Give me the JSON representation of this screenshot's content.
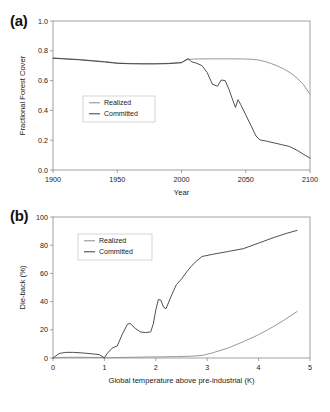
{
  "figure": {
    "panels": [
      {
        "id": "a",
        "label": "(a)",
        "xlabel": "Year",
        "ylabel": "Fractional Forest Cover",
        "xticks": [
          "1900",
          "1950",
          "2000",
          "2050",
          "2100"
        ],
        "yticks": [
          "0.0",
          "0.2",
          "0.4",
          "0.6",
          "0.8",
          "1.0"
        ],
        "legend": [
          {
            "name": "Realized",
            "color": "#8c8c8c"
          },
          {
            "name": "Committed",
            "color": "#3c3c3c"
          }
        ]
      },
      {
        "id": "b",
        "label": "(b)",
        "xlabel": "Global temperature above pre-industrial (K)",
        "ylabel": "Die-back (%)",
        "xticks": [
          "0",
          "1",
          "2",
          "3",
          "4",
          "5"
        ],
        "yticks": [
          "0",
          "20",
          "40",
          "60",
          "80",
          "100"
        ],
        "legend": [
          {
            "name": "Realized",
            "color": "#8c8c8c"
          },
          {
            "name": "Committed",
            "color": "#3c3c3c"
          }
        ]
      }
    ]
  },
  "chart_data": [
    {
      "type": "line",
      "panel": "a",
      "title": "",
      "xlabel": "Year",
      "ylabel": "Fractional Forest Cover",
      "xlim": [
        1900,
        2100
      ],
      "ylim": [
        0.0,
        1.0
      ],
      "xticks": [
        1900,
        1950,
        2000,
        2050,
        2100
      ],
      "yticks": [
        0.0,
        0.2,
        0.4,
        0.6,
        0.8,
        1.0
      ],
      "grid": false,
      "legend_position": "center-left",
      "series": [
        {
          "name": "Realized",
          "color": "#8c8c8c",
          "x": [
            1900,
            1920,
            1940,
            1950,
            1960,
            1970,
            1980,
            1990,
            2000,
            2005,
            2010,
            2020,
            2030,
            2040,
            2050,
            2055,
            2060,
            2065,
            2070,
            2075,
            2080,
            2085,
            2090,
            2095,
            2100
          ],
          "y": [
            0.752,
            0.742,
            0.728,
            0.718,
            0.715,
            0.714,
            0.714,
            0.716,
            0.722,
            0.742,
            0.745,
            0.746,
            0.746,
            0.746,
            0.745,
            0.743,
            0.738,
            0.728,
            0.714,
            0.697,
            0.676,
            0.651,
            0.617,
            0.572,
            0.508
          ]
        },
        {
          "name": "Committed",
          "color": "#3c3c3c",
          "x": [
            1900,
            1920,
            1940,
            1950,
            1960,
            1970,
            1980,
            1990,
            2000,
            2005,
            2008,
            2012,
            2016,
            2020,
            2024,
            2028,
            2031,
            2034,
            2037,
            2040,
            2042,
            2044,
            2046,
            2050,
            2054,
            2058,
            2061,
            2066,
            2072,
            2078,
            2084,
            2090,
            2096,
            2100
          ],
          "y": [
            0.75,
            0.74,
            0.725,
            0.716,
            0.713,
            0.712,
            0.712,
            0.714,
            0.72,
            0.748,
            0.726,
            0.716,
            0.7,
            0.654,
            0.576,
            0.562,
            0.604,
            0.6,
            0.54,
            0.466,
            0.42,
            0.472,
            0.44,
            0.37,
            0.3,
            0.228,
            0.202,
            0.194,
            0.182,
            0.17,
            0.158,
            0.132,
            0.1,
            0.08
          ]
        }
      ]
    },
    {
      "type": "line",
      "panel": "b",
      "title": "",
      "xlabel": "Global temperature above pre-industrial (K)",
      "ylabel": "Die-back (%)",
      "xlim": [
        0,
        5
      ],
      "ylim": [
        0,
        100
      ],
      "xticks": [
        0,
        1,
        2,
        3,
        4,
        5
      ],
      "yticks": [
        0,
        20,
        40,
        60,
        80,
        100
      ],
      "grid": false,
      "legend_position": "upper-left",
      "series": [
        {
          "name": "Realized",
          "color": "#8c8c8c",
          "x": [
            0.0,
            0.1,
            0.3,
            0.6,
            0.9,
            1.0,
            1.2,
            1.5,
            1.8,
            2.1,
            2.4,
            2.7,
            2.9,
            3.1,
            3.4,
            3.7,
            4.0,
            4.3,
            4.5,
            4.75
          ],
          "y": [
            0.0,
            0.3,
            0.5,
            0.5,
            0.4,
            0.2,
            0.3,
            0.5,
            0.7,
            0.8,
            1.0,
            1.3,
            1.8,
            3.6,
            7.0,
            11.5,
            16.5,
            22.5,
            27.0,
            33.0
          ]
        },
        {
          "name": "Committed",
          "color": "#3c3c3c",
          "x": [
            0.0,
            0.12,
            0.25,
            0.4,
            0.6,
            0.8,
            0.9,
            0.95,
            1.0,
            1.05,
            1.15,
            1.25,
            1.35,
            1.45,
            1.5,
            1.6,
            1.7,
            1.8,
            1.9,
            1.95,
            2.0,
            2.05,
            2.1,
            2.15,
            2.2,
            2.3,
            2.4,
            2.5,
            2.6,
            2.7,
            2.8,
            2.9,
            3.1,
            3.4,
            3.7,
            4.0,
            4.3,
            4.55,
            4.75
          ],
          "y": [
            0.0,
            3.2,
            4.0,
            4.0,
            3.5,
            2.8,
            2.4,
            1.2,
            0.2,
            3.0,
            7.0,
            8.5,
            17.0,
            24.0,
            24.5,
            21.0,
            18.5,
            18.0,
            18.5,
            24.0,
            34.0,
            41.5,
            41.0,
            36.0,
            35.0,
            44.0,
            52.0,
            56.0,
            61.0,
            65.5,
            69.0,
            72.0,
            73.5,
            75.5,
            77.5,
            81.5,
            85.5,
            88.5,
            90.5
          ]
        }
      ]
    }
  ]
}
